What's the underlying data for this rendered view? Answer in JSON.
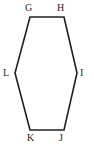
{
  "figure": {
    "kind": "hexagon-diagram",
    "canvas": {
      "width": 94,
      "height": 148
    },
    "background_color": "#ffffff",
    "stroke_color": "#231f20",
    "stroke_width": 1.6,
    "fill_color": "none",
    "label_color": "#231f20",
    "label_font_size": 10,
    "polygon_points": "30,17 64,17 77,73 64,130 30,130 15,73",
    "vertices": [
      {
        "id": "G",
        "label": "G",
        "x": 30,
        "y": 17,
        "label_x": 25,
        "label_y": 3
      },
      {
        "id": "H",
        "label": "H",
        "x": 64,
        "y": 17,
        "label_x": 57,
        "label_y": 3
      },
      {
        "id": "I",
        "label": "I",
        "x": 77,
        "y": 73,
        "label_x": 80,
        "label_y": 68
      },
      {
        "id": "J",
        "label": "J",
        "x": 64,
        "y": 130,
        "label_x": 59,
        "label_y": 133
      },
      {
        "id": "K",
        "label": "K",
        "x": 30,
        "y": 130,
        "label_x": 27,
        "label_y": 133
      },
      {
        "id": "L",
        "label": "L",
        "x": 15,
        "y": 73,
        "label_x": 3,
        "label_y": 68
      }
    ],
    "edges": [
      {
        "from": "G",
        "to": "H"
      },
      {
        "from": "H",
        "to": "I"
      },
      {
        "from": "I",
        "to": "J"
      },
      {
        "from": "J",
        "to": "K"
      },
      {
        "from": "K",
        "to": "L"
      },
      {
        "from": "L",
        "to": "G"
      }
    ]
  }
}
